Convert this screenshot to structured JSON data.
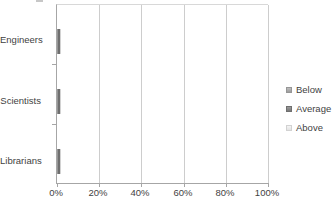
{
  "chart_data": {
    "type": "bar",
    "orientation": "horizontal",
    "stacked": true,
    "title": "",
    "xlabel": "",
    "ylabel": "",
    "categories": [
      "Engineers",
      "Scientists",
      "Librarians"
    ],
    "series": [
      {
        "name": "Below",
        "values": [
          49,
          34,
          20
        ],
        "color": "#a9a9a9"
      },
      {
        "name": "Average",
        "values": [
          21,
          29,
          50
        ],
        "color": "#8a8a8a"
      },
      {
        "name": "Above",
        "values": [
          30,
          37,
          30
        ],
        "color": "#ededed"
      }
    ],
    "x_ticks": [
      "0%",
      "20%",
      "40%",
      "60%",
      "80%",
      "100%"
    ],
    "xlim": [
      0,
      100
    ],
    "grid": true,
    "gridline_color": "#cdcdcd",
    "axis_color": "#a6a6a6",
    "text_color": "#3f3f3f",
    "legend_position": "right",
    "background_color": "#ffffff"
  }
}
